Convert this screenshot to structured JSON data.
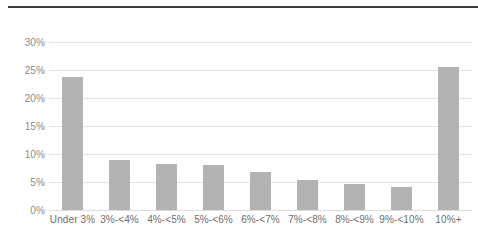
{
  "chart_data": {
    "type": "bar",
    "title": "",
    "subtitle": "",
    "xlabel": "",
    "ylabel": "",
    "categories": [
      "Under 3%",
      "3%-<4%",
      "4%-<5%",
      "5%-<6%",
      "6%-<7%",
      "7%-<8%",
      "8%-<9%",
      "9%-<10%",
      "10%+"
    ],
    "values": [
      23.8,
      8.9,
      8.2,
      8.0,
      6.8,
      5.4,
      4.6,
      4.1,
      25.5
    ],
    "value_labels": [
      "",
      "",
      "",
      "",
      "",
      "",
      "",
      "",
      ""
    ],
    "ylim": [
      0,
      30
    ],
    "yticks": [
      0,
      5,
      10,
      15,
      20,
      25,
      30
    ],
    "ytick_labels": [
      "0%",
      "5%",
      "10%",
      "15%",
      "20%",
      "25%",
      "30%"
    ],
    "grid": true,
    "grid_axis": "y",
    "legend": false,
    "legend_position": "none",
    "bar_color": "#b3b3b3",
    "gridline_color": "#e3e3e3",
    "tick_label_color": "#8a8a8a",
    "category_label_color": "#6e6e6e",
    "rule_color": "#3c3c3c",
    "background_color": "#ffffff"
  }
}
